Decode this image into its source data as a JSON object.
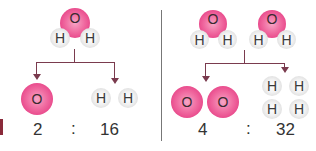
{
  "colors": {
    "oxygen": "#e8478a",
    "hydrogen": "#e8e8e8",
    "arrow": "#7a3b4e",
    "divider": "#777777",
    "text": "#333333"
  },
  "left": {
    "molecule": {
      "o": "O",
      "h1": "H",
      "h2": "H"
    },
    "products": {
      "o": "O",
      "h1": "H",
      "h2": "H"
    },
    "ratio": {
      "o_mass": "2",
      "sep": ":",
      "h_mass": "16"
    }
  },
  "right": {
    "molecule1": {
      "o": "O",
      "h1": "H",
      "h2": "H"
    },
    "molecule2": {
      "o": "O",
      "h1": "H",
      "h2": "H"
    },
    "products": {
      "o1": "O",
      "o2": "O",
      "h1": "H",
      "h2": "H",
      "h3": "H",
      "h4": "H"
    },
    "ratio": {
      "o_mass": "4",
      "sep": ":",
      "h_mass": "32"
    }
  }
}
